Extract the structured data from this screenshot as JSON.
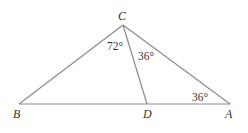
{
  "diagram": {
    "type": "triangle",
    "vertices": {
      "A": {
        "label": "A",
        "x": 230,
        "y": 104
      },
      "B": {
        "label": "B",
        "x": 19,
        "y": 104
      },
      "C": {
        "label": "C",
        "x": 123,
        "y": 25
      },
      "D": {
        "label": "D",
        "x": 147,
        "y": 104
      }
    },
    "segments": [
      "BC",
      "CA",
      "BA",
      "CD"
    ],
    "angles": {
      "BCD": "72°",
      "DCA": "36°",
      "CAD": "36°"
    },
    "colors": {
      "line": "#8a8a8a",
      "text": "#333333"
    }
  }
}
